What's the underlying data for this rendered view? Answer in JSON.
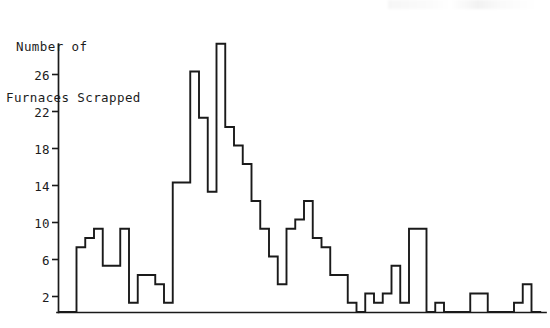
{
  "figure": {
    "axis_title_lines": [
      "Number of",
      "Furnaces Scrapped"
    ],
    "ink_color": "#1a1a1a",
    "background_color": "#ffffff"
  },
  "chart_data": {
    "type": "bar",
    "title": "",
    "subtitle": "",
    "ylabel": "Number of Furnaces Scrapped",
    "xlabel": "",
    "grid": false,
    "legend": null,
    "ylim": [
      0,
      30
    ],
    "yticks": [
      2,
      6,
      10,
      14,
      18,
      22,
      26
    ],
    "ytick_labels": [
      "2",
      "6",
      "10",
      "14",
      "18",
      "22",
      "26"
    ],
    "xticks": [],
    "xtick_labels": [],
    "bar_gap": 0,
    "note": "Histogram / step outline of counts per equal-width bin; bins unlabeled on the x-axis.",
    "categories": [
      "1",
      "2",
      "3",
      "4",
      "5",
      "6",
      "7",
      "8",
      "9",
      "10",
      "11",
      "12",
      "13",
      "14",
      "15",
      "16",
      "17",
      "18",
      "19",
      "20",
      "21",
      "22",
      "23",
      "24",
      "25",
      "26",
      "27",
      "28",
      "29",
      "30",
      "31",
      "32",
      "33",
      "34",
      "35",
      "36",
      "37",
      "38",
      "39",
      "40",
      "41",
      "42",
      "43",
      "44",
      "45",
      "46",
      "47",
      "48",
      "49",
      "50",
      "51",
      "52",
      "53",
      "54",
      "55"
    ],
    "values": [
      0,
      0,
      7,
      8,
      9,
      5,
      5,
      9,
      1,
      4,
      4,
      3,
      1,
      14,
      14,
      26,
      21,
      13,
      29,
      20,
      18,
      16,
      12,
      9,
      6,
      3,
      9,
      10,
      12,
      8,
      7,
      4,
      4,
      1,
      0,
      2,
      1,
      2,
      5,
      1,
      9,
      9,
      0,
      1,
      0,
      0,
      0,
      2,
      2,
      0,
      0,
      0,
      1,
      3,
      0
    ]
  }
}
